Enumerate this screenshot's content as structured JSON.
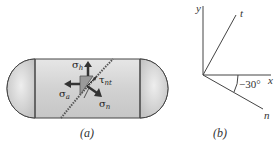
{
  "figure_a": {
    "caption": "(a)",
    "labels": {
      "sigma_h": "σh",
      "sigma_a": "σa",
      "sigma_n": "σn",
      "tau_nt": "τnt"
    },
    "colors": {
      "tank_fill": "#d8d8d8",
      "element_fill": "#9a9a9a",
      "arrow": "#333333",
      "weld": "#555555"
    }
  },
  "figure_b": {
    "caption": "(b)",
    "axes": {
      "y": "y",
      "x": "x",
      "t": "t",
      "n": "n"
    },
    "angle_label": "−30°"
  }
}
